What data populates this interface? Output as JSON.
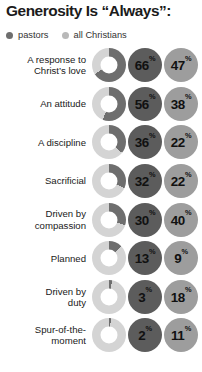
{
  "header": {
    "title": "Generosity Is “Always”:"
  },
  "legend": {
    "position": "top-left",
    "items": [
      {
        "label": "pastors",
        "color": "#6e6e6e",
        "dot": "legend-dot-icon"
      },
      {
        "label": "all Christians",
        "color": "#b9b9b9",
        "dot": "legend-dot-icon"
      }
    ]
  },
  "symbols": {
    "percent": "%"
  },
  "colors": {
    "pastors": "#5c5c5c",
    "all_christians": "#9d9d9d",
    "donut_track": "#d4d4d4",
    "donut_wedge": "#6e6e6e",
    "title": "#1b1b1b",
    "background": "#ffffff"
  },
  "chart_data": {
    "type": "pie",
    "title": "Generosity Is “Always”:",
    "subtitle": "",
    "xlabel": "",
    "ylabel": "",
    "units": "%",
    "grid": false,
    "legend_position": "top-left",
    "categories": [
      "A response to Christ’s love",
      "An attitude",
      "A discipline",
      "Sacrificial",
      "Driven by compassion",
      "Planned",
      "Driven by duty",
      "Spur-of-the-moment"
    ],
    "series": [
      {
        "name": "pastors",
        "color": "#5c5c5c",
        "values": [
          66,
          56,
          36,
          32,
          30,
          13,
          3,
          2
        ]
      },
      {
        "name": "all Christians",
        "color": "#9d9d9d",
        "values": [
          47,
          38,
          22,
          22,
          40,
          9,
          18,
          11
        ]
      }
    ],
    "rows": [
      {
        "label": "A response to Christ’s love",
        "label_lines": [
          "A response to",
          "Christ’s love"
        ],
        "pastors": 66,
        "all_christians": 47
      },
      {
        "label": "An attitude",
        "label_lines": [
          "An attitude"
        ],
        "pastors": 56,
        "all_christians": 38
      },
      {
        "label": "A discipline",
        "label_lines": [
          "A discipline"
        ],
        "pastors": 36,
        "all_christians": 22
      },
      {
        "label": "Sacrificial",
        "label_lines": [
          "Sacrificial"
        ],
        "pastors": 32,
        "all_christians": 22
      },
      {
        "label": "Driven by compassion",
        "label_lines": [
          "Driven by",
          "compassion"
        ],
        "pastors": 30,
        "all_christians": 40
      },
      {
        "label": "Planned",
        "label_lines": [
          "Planned"
        ],
        "pastors": 13,
        "all_christians": 9
      },
      {
        "label": "Driven by duty",
        "label_lines": [
          "Driven by",
          "duty"
        ],
        "pastors": 3,
        "all_christians": 18
      },
      {
        "label": "Spur-of-the-moment",
        "label_lines": [
          "Spur-of-the-",
          "moment"
        ],
        "pastors": 2,
        "all_christians": 11
      }
    ]
  }
}
